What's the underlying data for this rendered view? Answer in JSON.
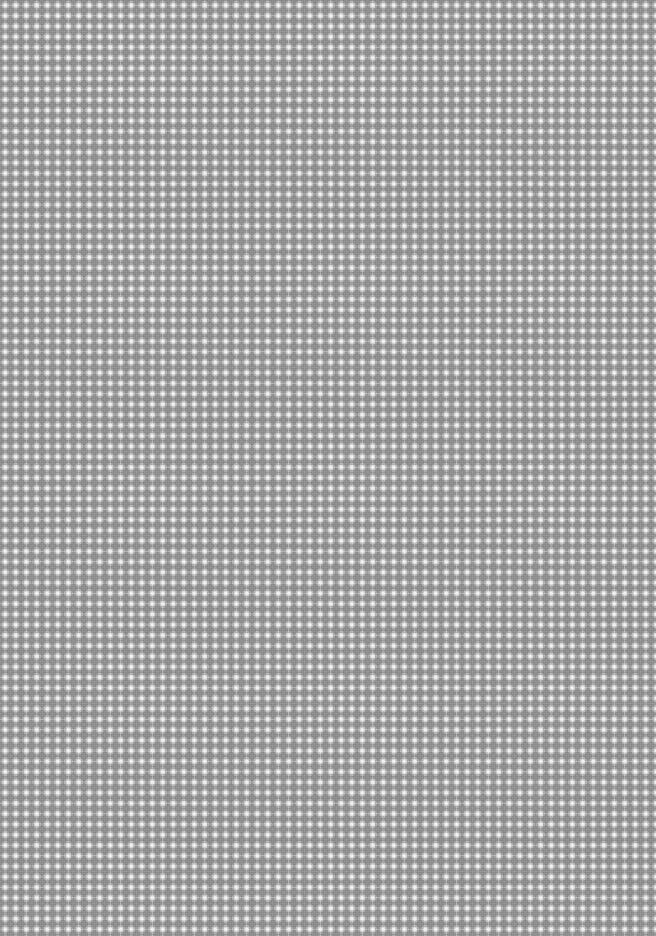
{
  "image": {
    "description": "Uniform gray diamond / checker halftone texture",
    "pattern": "diamond-grid",
    "period_px": 10.5,
    "colors": {
      "base": "#a4a4a4",
      "dark_diamond": "#6e6e6e",
      "light_dot": "#f2f2f2"
    }
  }
}
